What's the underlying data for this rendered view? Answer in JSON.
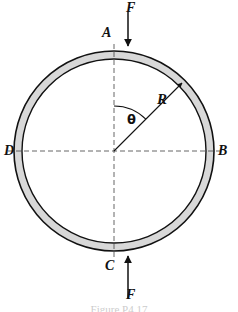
{
  "figure": {
    "caption": "Figure P4.17",
    "background_color": "#ffffff",
    "line_color": "#111111",
    "ring_fill_color": "#d8d8d8",
    "dashed_line_color": "#555555"
  },
  "geometry": {
    "center_x": 114,
    "center_y": 151,
    "outer_radius": 100,
    "ring_thickness": 8,
    "radius_angle_deg": 45
  },
  "labels": {
    "point_a": "A",
    "point_b": "B",
    "point_c": "C",
    "point_d": "D",
    "force_top": "F",
    "force_bottom": "F",
    "radius": "R",
    "angle": "θ"
  },
  "annotations": {
    "force_top_direction": "down",
    "force_bottom_direction": "up",
    "radius_arrow_direction": "outward",
    "angle_measured_from": "vertical-axis",
    "angle_sweep": "clockwise-to-radius"
  }
}
